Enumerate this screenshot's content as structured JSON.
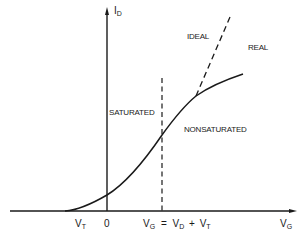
{
  "diagram": {
    "type": "MOSFET transfer characteristic (I_D vs V_G)",
    "y_axis": {
      "symbol": "I",
      "subscript": "D"
    },
    "x_axis": {
      "symbol": "V",
      "subscript": "G"
    },
    "curves": [
      {
        "name": "REAL",
        "style": "solid"
      },
      {
        "name": "IDEAL",
        "style": "dashed"
      }
    ],
    "regions": {
      "left": "SATURATED",
      "right": "NONSATURATED"
    },
    "x_ticks": {
      "vt": {
        "symbol": "V",
        "subscript": "T"
      },
      "zero": "0",
      "boundary": {
        "lhs_symbol": "V",
        "lhs_subscript": "G",
        "eq": "=",
        "vd_symbol": "V",
        "vd_subscript": "D",
        "plus": "+",
        "vt_symbol": "V",
        "vt_subscript": "T"
      }
    },
    "colors": {
      "line": "#1a1a1a",
      "background": "#ffffff"
    }
  }
}
